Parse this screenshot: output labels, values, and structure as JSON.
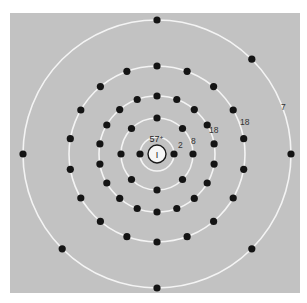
{
  "diagram": {
    "center": [
      157,
      154
    ],
    "background_color": "#c2c2c2",
    "panel": {
      "x": 10,
      "y": 13,
      "width": 290,
      "height": 280
    },
    "nucleus": {
      "symbol": "I",
      "charge_label": "57⁺",
      "radius": 9
    },
    "shells": [
      {
        "index": 1,
        "radius": 17,
        "electron_count": 2,
        "label": "2",
        "label_pos": [
          178,
          148
        ],
        "start_angle_deg": 0
      },
      {
        "index": 2,
        "radius": 36,
        "electron_count": 8,
        "label": "8",
        "label_pos": [
          191,
          144
        ],
        "start_angle_deg": 0
      },
      {
        "index": 3,
        "radius": 58,
        "electron_count": 18,
        "label": "18",
        "label_pos": [
          209,
          133
        ],
        "start_angle_deg": 0
      },
      {
        "index": 4,
        "radius": 88,
        "electron_count": 18,
        "label": "18",
        "label_pos": [
          240,
          125
        ],
        "start_angle_deg": 0
      },
      {
        "index": 5,
        "radius": 134,
        "electron_count": 7,
        "label": "7",
        "label_pos": [
          281,
          110
        ],
        "start_angle_deg": 0
      }
    ],
    "electron_radius": 3.6,
    "electron_angles_deg": [
      [
        0,
        180
      ],
      [
        0,
        45,
        90,
        135,
        180,
        225,
        270,
        315
      ],
      [
        0,
        20,
        40,
        60,
        90,
        120,
        140,
        160,
        180,
        200,
        220,
        240,
        270,
        300,
        320,
        340,
        20,
        340
      ],
      [
        0,
        20,
        40,
        60,
        80,
        100,
        120,
        140,
        160,
        180,
        200,
        220,
        240,
        260,
        280,
        300,
        320,
        340
      ],
      [
        0,
        45,
        90,
        135,
        180,
        225,
        270
      ]
    ],
    "shell_configuration": "2, 8, 18, 18, 7"
  }
}
